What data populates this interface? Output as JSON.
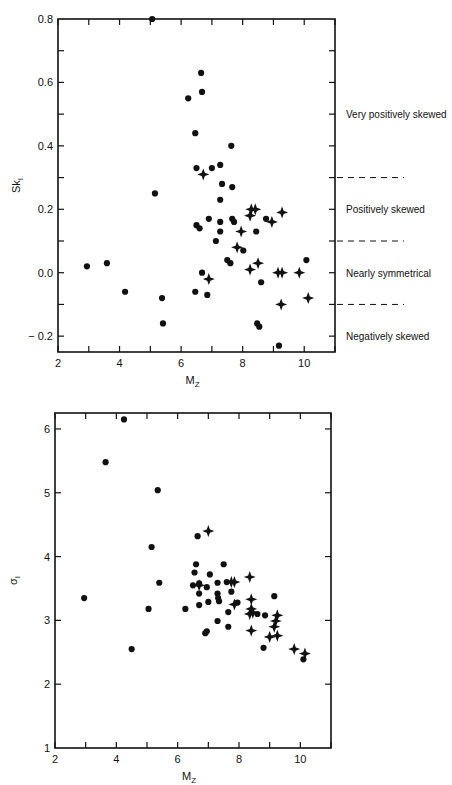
{
  "chart_data": [
    {
      "type": "scatter",
      "title": "",
      "xlabel": "Mz",
      "ylabel": "Sk_I",
      "xlim": [
        2,
        11
      ],
      "ylim": [
        -0.25,
        0.8
      ],
      "xticks": [
        "2",
        "4",
        "6",
        "8",
        "10"
      ],
      "yticks": [
        "-0.2",
        "0.0",
        "0.2",
        "0.4",
        "0.6",
        "0.8"
      ],
      "grid": false,
      "zones": [
        {
          "label": "Very positively skewed",
          "range": [
            0.3,
            0.8
          ]
        },
        {
          "label": "Positively skewed",
          "range": [
            0.1,
            0.3
          ]
        },
        {
          "label": "Nearly symmetrical",
          "range": [
            -0.1,
            0.1
          ]
        },
        {
          "label": "Negatively skewed",
          "range": [
            -0.3,
            -0.1
          ]
        }
      ],
      "zone_boundaries": [
        0.3,
        0.1,
        -0.1
      ],
      "series": [
        {
          "name": "dots",
          "marker": "circle",
          "points": [
            [
              5.06,
              0.8
            ],
            [
              6.65,
              0.63
            ],
            [
              6.68,
              0.57
            ],
            [
              6.23,
              0.55
            ],
            [
              6.46,
              0.44
            ],
            [
              7.63,
              0.4
            ],
            [
              6.5,
              0.33
            ],
            [
              7.0,
              0.33
            ],
            [
              7.27,
              0.34
            ],
            [
              7.33,
              0.28
            ],
            [
              7.66,
              0.27
            ],
            [
              7.27,
              0.23
            ],
            [
              5.15,
              0.25
            ],
            [
              8.76,
              0.17
            ],
            [
              6.5,
              0.15
            ],
            [
              6.6,
              0.14
            ],
            [
              6.9,
              0.17
            ],
            [
              7.27,
              0.16
            ],
            [
              7.66,
              0.17
            ],
            [
              7.72,
              0.16
            ],
            [
              8.44,
              0.13
            ],
            [
              7.27,
              0.13
            ],
            [
              7.13,
              0.1
            ],
            [
              8.02,
              0.07
            ],
            [
              7.5,
              0.04
            ],
            [
              7.6,
              0.03
            ],
            [
              2.94,
              0.02
            ],
            [
              3.59,
              0.03
            ],
            [
              10.07,
              0.04
            ],
            [
              6.68,
              0.0
            ],
            [
              8.6,
              -0.03
            ],
            [
              6.46,
              -0.06
            ],
            [
              4.18,
              -0.06
            ],
            [
              6.85,
              -0.07
            ],
            [
              5.38,
              -0.08
            ],
            [
              5.41,
              -0.16
            ],
            [
              8.47,
              -0.16
            ],
            [
              8.54,
              -0.17
            ],
            [
              9.18,
              -0.23
            ]
          ]
        },
        {
          "name": "stars",
          "marker": "star",
          "points": [
            [
              6.72,
              0.31
            ],
            [
              8.28,
              0.2
            ],
            [
              8.41,
              0.2
            ],
            [
              8.24,
              0.18
            ],
            [
              9.28,
              0.19
            ],
            [
              8.95,
              0.16
            ],
            [
              7.95,
              0.13
            ],
            [
              7.82,
              0.08
            ],
            [
              8.5,
              0.03
            ],
            [
              8.24,
              0.01
            ],
            [
              9.15,
              0.0
            ],
            [
              9.28,
              0.0
            ],
            [
              9.84,
              0.0
            ],
            [
              6.9,
              -0.02
            ],
            [
              10.13,
              -0.08
            ],
            [
              9.25,
              -0.1
            ]
          ]
        }
      ]
    },
    {
      "type": "scatter",
      "title": "",
      "xlabel": "Mz",
      "ylabel": "σ_I",
      "xlim": [
        2,
        11
      ],
      "ylim": [
        1,
        6.25
      ],
      "xticks": [
        "2",
        "4",
        "6",
        "8",
        "10"
      ],
      "yticks": [
        "1",
        "2",
        "3",
        "4",
        "5",
        "6"
      ],
      "grid": false,
      "series": [
        {
          "name": "dots",
          "marker": "circle",
          "points": [
            [
              4.25,
              6.15
            ],
            [
              3.65,
              5.48
            ],
            [
              5.35,
              5.04
            ],
            [
              6.65,
              4.32
            ],
            [
              5.15,
              4.15
            ],
            [
              2.95,
              3.35
            ],
            [
              5.05,
              3.18
            ],
            [
              5.4,
              3.59
            ],
            [
              6.25,
              3.18
            ],
            [
              6.6,
              3.88
            ],
            [
              7.5,
              3.88
            ],
            [
              6.55,
              3.75
            ],
            [
              7.05,
              3.72
            ],
            [
              6.5,
              3.55
            ],
            [
              6.7,
              3.58
            ],
            [
              6.7,
              3.42
            ],
            [
              6.95,
              3.52
            ],
            [
              7.3,
              3.59
            ],
            [
              7.6,
              3.6
            ],
            [
              7.75,
              3.45
            ],
            [
              7.3,
              3.42
            ],
            [
              7.32,
              3.35
            ],
            [
              7.35,
              3.3
            ],
            [
              6.7,
              3.24
            ],
            [
              7.0,
              3.29
            ],
            [
              7.65,
              3.13
            ],
            [
              7.95,
              3.28
            ],
            [
              8.6,
              3.1
            ],
            [
              8.85,
              3.08
            ],
            [
              9.15,
              3.38
            ],
            [
              6.9,
              2.8
            ],
            [
              6.95,
              2.83
            ],
            [
              7.3,
              2.99
            ],
            [
              7.65,
              2.9
            ],
            [
              8.8,
              2.57
            ],
            [
              10.1,
              2.39
            ],
            [
              4.5,
              2.55
            ]
          ]
        },
        {
          "name": "stars",
          "marker": "star",
          "points": [
            [
              7.0,
              4.4
            ],
            [
              6.7,
              3.55
            ],
            [
              7.75,
              3.6
            ],
            [
              7.85,
              3.6
            ],
            [
              8.35,
              3.68
            ],
            [
              7.85,
              3.25
            ],
            [
              8.4,
              3.33
            ],
            [
              8.4,
              3.18
            ],
            [
              8.35,
              3.1
            ],
            [
              8.45,
              3.12
            ],
            [
              9.25,
              3.08
            ],
            [
              9.2,
              2.99
            ],
            [
              9.15,
              2.9
            ],
            [
              8.4,
              2.84
            ],
            [
              9.0,
              2.74
            ],
            [
              9.25,
              2.76
            ],
            [
              9.8,
              2.55
            ],
            [
              10.15,
              2.48
            ]
          ]
        }
      ]
    }
  ],
  "chart1": {
    "xlabel_main": "M",
    "xlabel_sub": "Z",
    "ylabel_main": "Sk",
    "ylabel_sub": "I",
    "zone_labels": [
      "Very positively skewed",
      "Positively skewed",
      "Nearly symmetrical",
      "Negatively skewed"
    ]
  },
  "chart2": {
    "xlabel_main": "M",
    "xlabel_sub": "Z",
    "ylabel_main": "σ",
    "ylabel_sub": "I"
  }
}
